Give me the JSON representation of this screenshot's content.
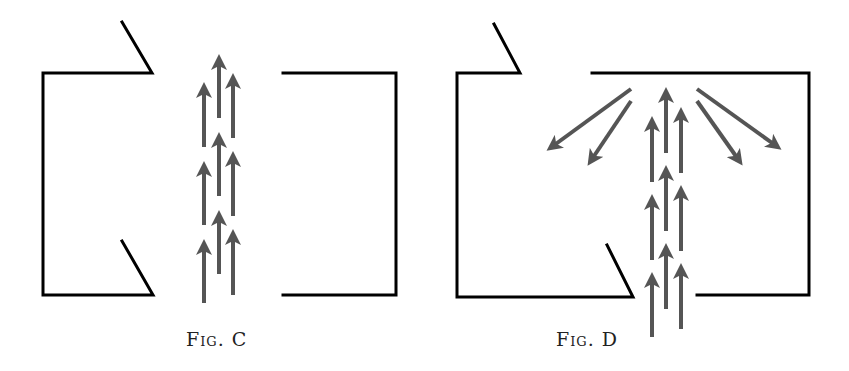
{
  "figures": [
    {
      "id": "C",
      "caption": "Fig. C",
      "description": "Two opposing open boxes with a straight upward airflow passing through the gap between them",
      "wall_color": "#000000",
      "arrow_color": "#555555"
    },
    {
      "id": "D",
      "caption": "Fig. D",
      "description": "Box with openings at top-left and bottom; upward airflow enters from bottom and is deflected outward by the top wall",
      "wall_color": "#000000",
      "arrow_color": "#555555"
    }
  ]
}
